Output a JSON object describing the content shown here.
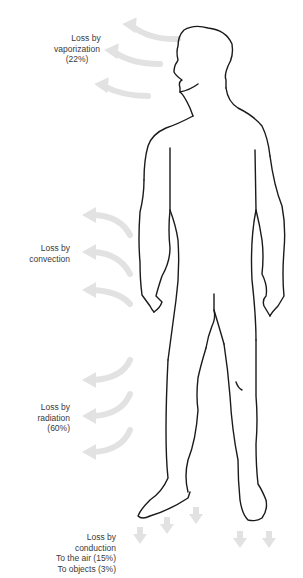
{
  "diagram": {
    "colors": {
      "outline": "#1a1a1a",
      "arrow": "#e2e2e2",
      "label_text": "#3a3a3a",
      "background": "#ffffff"
    },
    "labels": {
      "vaporization": {
        "line1": "Loss by",
        "line2": "vaporization",
        "line3": "(22%)"
      },
      "convection": {
        "line1": "Loss by",
        "line2": "convection"
      },
      "radiation": {
        "line1": "Loss by",
        "line2": "radiation",
        "line3": "(60%)"
      },
      "conduction": {
        "line1": "Loss by",
        "line2": "conduction",
        "line3": "To the air (15%)",
        "line4": "To objects (3%)"
      }
    },
    "arrow_groups": [
      {
        "name": "vaporization-arrows",
        "count": 3,
        "direction": "left-curved"
      },
      {
        "name": "convection-arrows",
        "count": 3,
        "direction": "left-curved"
      },
      {
        "name": "radiation-arrows",
        "count": 3,
        "direction": "left-curved-down"
      },
      {
        "name": "conduction-arrows",
        "count": 5,
        "direction": "down"
      }
    ]
  }
}
